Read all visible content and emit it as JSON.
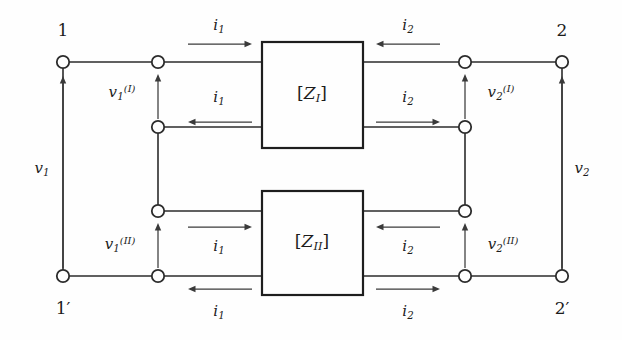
{
  "figure": {
    "kind": "two-port-network-series-connection-diagram",
    "colors": {
      "background": "#fefefe",
      "wire": "#2b2b2b",
      "box_border": "#1e1e1e",
      "arrow": "#3a3a3a",
      "text": "#1c1c1c"
    }
  },
  "terminals": [
    {
      "name": "terminal-1",
      "label": "1",
      "x": 63,
      "y": 62,
      "label_x": 63,
      "label_y": 30
    },
    {
      "name": "terminal-2",
      "label": "2",
      "x": 562,
      "y": 62,
      "label_x": 562,
      "label_y": 30
    },
    {
      "name": "terminal-1-prime",
      "label": "1′",
      "x": 63,
      "y": 276,
      "label_x": 63,
      "label_y": 308
    },
    {
      "name": "terminal-2-prime",
      "label": "2′",
      "x": 562,
      "y": 276,
      "label_x": 562,
      "label_y": 308
    }
  ],
  "inner_nodes": [
    {
      "name": "node-left-upper-top",
      "x": 158,
      "y": 62
    },
    {
      "name": "node-left-upper-bottom",
      "x": 158,
      "y": 127
    },
    {
      "name": "node-left-lower-top",
      "x": 158,
      "y": 211
    },
    {
      "name": "node-left-lower-bottom",
      "x": 158,
      "y": 276
    },
    {
      "name": "node-right-upper-top",
      "x": 465,
      "y": 62
    },
    {
      "name": "node-right-upper-bottom",
      "x": 465,
      "y": 127
    },
    {
      "name": "node-right-lower-top",
      "x": 465,
      "y": 211
    },
    {
      "name": "node-right-lower-bottom",
      "x": 465,
      "y": 276
    }
  ],
  "boxes": [
    {
      "name": "network-box-z1",
      "label_base": "Z",
      "label_sub": "I",
      "label_open": "[",
      "label_close": "]",
      "x": 262,
      "y": 42,
      "w": 101,
      "h": 106,
      "label_x": 312,
      "label_y": 95
    },
    {
      "name": "network-box-z2",
      "label_base": "Z",
      "label_sub": "II",
      "label_open": "[",
      "label_close": "]",
      "x": 262,
      "y": 191,
      "w": 101,
      "h": 104,
      "label_x": 312,
      "label_y": 243
    }
  ],
  "current_labels": [
    {
      "name": "current-i1-top-in",
      "base": "i",
      "sub": "1",
      "x": 219,
      "y": 27,
      "dir": "right",
      "arrow": {
        "x1": 188,
        "x2": 252,
        "y": 44
      }
    },
    {
      "name": "current-i2-top-in",
      "base": "i",
      "sub": "2",
      "x": 408,
      "y": 27,
      "dir": "left",
      "arrow": {
        "x1": 440,
        "x2": 376,
        "y": 44
      }
    },
    {
      "name": "current-i1-upper-ret",
      "base": "i",
      "sub": "1",
      "x": 219,
      "y": 99,
      "dir": "left",
      "arrow": {
        "x1": 252,
        "x2": 188,
        "y": 122
      }
    },
    {
      "name": "current-i2-upper-ret",
      "base": "i",
      "sub": "2",
      "x": 408,
      "y": 99,
      "dir": "right",
      "arrow": {
        "x1": 376,
        "x2": 440,
        "y": 122
      }
    },
    {
      "name": "current-i1-lower-in",
      "base": "i",
      "sub": "1",
      "x": 219,
      "y": 248,
      "dir": "right",
      "arrow": {
        "x1": 188,
        "x2": 252,
        "y": 227
      }
    },
    {
      "name": "current-i2-lower-in",
      "base": "i",
      "sub": "2",
      "x": 408,
      "y": 248,
      "dir": "left",
      "arrow": {
        "x1": 440,
        "x2": 376,
        "y": 227
      }
    },
    {
      "name": "current-i1-bottom-ret",
      "base": "i",
      "sub": "1",
      "x": 219,
      "y": 313,
      "dir": "left",
      "arrow": {
        "x1": 252,
        "x2": 188,
        "y": 289
      }
    },
    {
      "name": "current-i2-bottom-ret",
      "base": "i",
      "sub": "2",
      "x": 408,
      "y": 313,
      "dir": "right",
      "arrow": {
        "x1": 376,
        "x2": 440,
        "y": 289
      }
    }
  ],
  "voltage_labels": [
    {
      "name": "voltage-v1",
      "base": "v",
      "sub": "1",
      "sup": "",
      "x": 42,
      "y": 170,
      "arrow": {
        "x": 63,
        "y1": 268,
        "y2": 76
      }
    },
    {
      "name": "voltage-v2",
      "base": "v",
      "sub": "2",
      "sup": "",
      "x": 582,
      "y": 170,
      "arrow": {
        "x": 562,
        "y1": 268,
        "y2": 76
      }
    },
    {
      "name": "voltage-v1-port-I",
      "base": "v",
      "sub": "1",
      "sup": "(I)",
      "x": 122,
      "y": 93,
      "arrow": {
        "x": 158,
        "y1": 119,
        "y2": 74
      }
    },
    {
      "name": "voltage-v2-port-I",
      "base": "v",
      "sub": "2",
      "sup": "(I)",
      "x": 501,
      "y": 93,
      "arrow": {
        "x": 465,
        "y1": 119,
        "y2": 74
      }
    },
    {
      "name": "voltage-v1-port-II",
      "base": "v",
      "sub": "1",
      "sup": "(II)",
      "x": 120,
      "y": 245,
      "arrow": {
        "x": 158,
        "y1": 268,
        "y2": 223
      }
    },
    {
      "name": "voltage-v2-port-II",
      "base": "v",
      "sub": "2",
      "sup": "(II)",
      "x": 503,
      "y": 245,
      "arrow": {
        "x": 465,
        "y1": 268,
        "y2": 223
      }
    }
  ],
  "wires": [
    {
      "name": "wire-terminal1-to-node",
      "d": "M 69 62 L 152 62"
    },
    {
      "name": "wire-node-to-box1-tl",
      "d": "M 164 62 L 262 62"
    },
    {
      "name": "wire-box1-bl-to-node",
      "d": "M 262 127 L 164 127"
    },
    {
      "name": "wire-box1-tr-to-node",
      "d": "M 363 62 L 459 62"
    },
    {
      "name": "wire-node-to-terminal2",
      "d": "M 471 62 L 556 62"
    },
    {
      "name": "wire-box1-br-to-node",
      "d": "M 363 127 L 459 127"
    },
    {
      "name": "wire-left-bridge",
      "d": "M 158 133 L 158 205"
    },
    {
      "name": "wire-right-bridge",
      "d": "M 465 133 L 465 205"
    },
    {
      "name": "wire-node-to-box2-tl",
      "d": "M 164 211 L 262 211"
    },
    {
      "name": "wire-box2-bl-to-node",
      "d": "M 262 276 L 164 276"
    },
    {
      "name": "wire-box2-tr-to-node",
      "d": "M 363 211 L 459 211"
    },
    {
      "name": "wire-box2-br-to-node",
      "d": "M 363 276 L 459 276"
    },
    {
      "name": "wire-terminal1p-to-node",
      "d": "M 69 276 L 152 276"
    },
    {
      "name": "wire-node-to-terminal2p",
      "d": "M 471 276 L 556 276"
    },
    {
      "name": "wire-left-rail",
      "d": "M 63 270 L 63 68"
    },
    {
      "name": "wire-right-rail",
      "d": "M 562 270 L 562 68"
    }
  ]
}
